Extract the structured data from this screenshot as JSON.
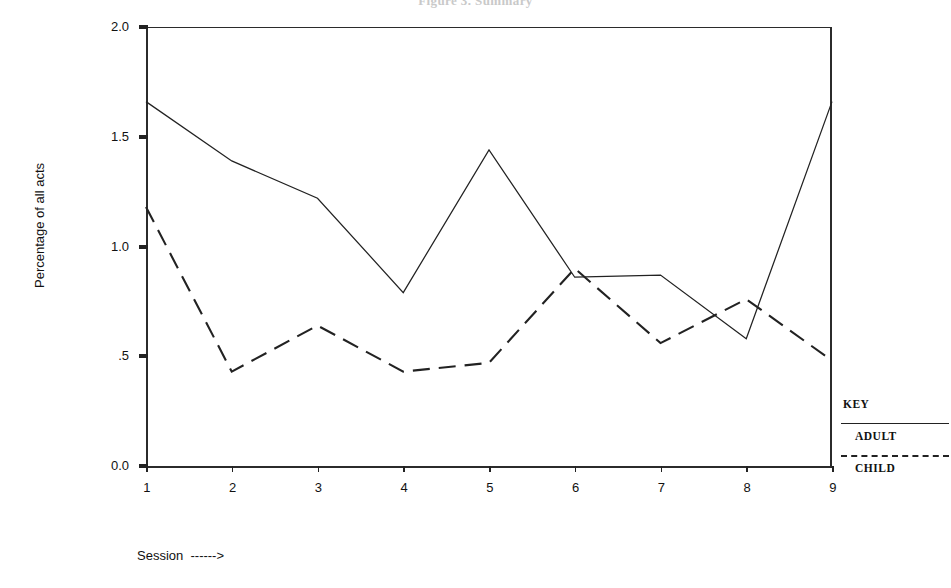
{
  "figure": {
    "clipped_title": "Figure 3.  Summary",
    "ylabel": "Percentage of all acts",
    "xlabel": "Session  ------>"
  },
  "legend": {
    "title": "KEY",
    "entries": [
      {
        "label": "ADULT",
        "style": "solid"
      },
      {
        "label": "CHILD",
        "style": "dashed"
      }
    ]
  },
  "chart_data": {
    "type": "line",
    "title": "",
    "xlabel": "Session  ------>",
    "ylabel": "Percentage of all acts",
    "x": [
      1,
      2,
      3,
      4,
      5,
      6,
      7,
      8,
      9
    ],
    "xtick_labels": [
      "1",
      "2",
      "3",
      "4",
      "5",
      "6",
      "7",
      "8",
      "9"
    ],
    "ytick_values": [
      2.0,
      1.5,
      1.0,
      0.5,
      0.0
    ],
    "ytick_labels": [
      "2.0",
      "1.5",
      "1.0",
      ".5",
      "0.0"
    ],
    "xlim": [
      1,
      9
    ],
    "ylim": [
      0.0,
      2.0
    ],
    "grid": false,
    "legend_position": "right",
    "series": [
      {
        "name": "ADULT",
        "style": "solid",
        "color": "#222222",
        "values": [
          1.66,
          1.39,
          1.22,
          0.79,
          1.44,
          0.86,
          0.87,
          0.58,
          1.66
        ]
      },
      {
        "name": "CHILD",
        "style": "dashed",
        "color": "#222222",
        "values": [
          1.18,
          0.43,
          0.64,
          0.43,
          0.47,
          0.9,
          0.56,
          0.76,
          0.48
        ]
      }
    ]
  }
}
